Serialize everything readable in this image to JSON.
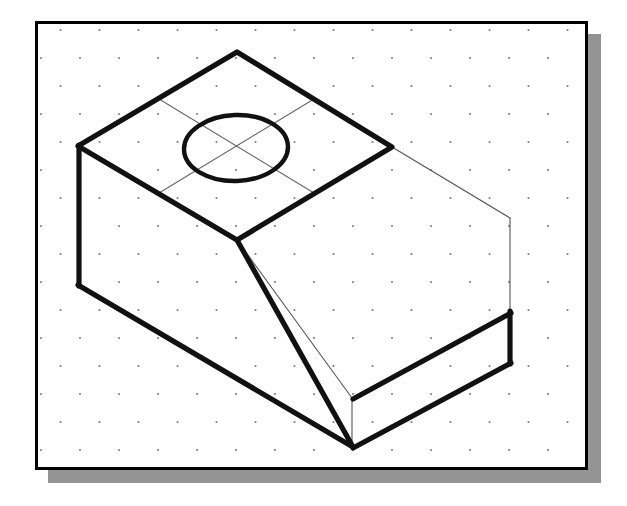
{
  "canvas": {
    "width": 627,
    "height": 506,
    "background_color": "#ffffff",
    "title": "Isometric pictorial drawing of a truncated rectangular block with a through hole"
  },
  "frame": {
    "name": "drawing-border",
    "x": 35,
    "y": 21,
    "width": 553,
    "height": 449,
    "stroke_color": "#000000",
    "stroke_width": 3,
    "fill_color": "#ffffff"
  },
  "shadow": {
    "name": "drop-shadow",
    "offset_x": 13,
    "offset_y": 13,
    "color": "#949494"
  },
  "grid": {
    "name": "isometric-dot-grid",
    "visible": true,
    "dot_color": "#808080",
    "dot_radius": 1.1,
    "spacing_x": 39,
    "spacing_y": 28,
    "stagger": true,
    "origin_x": 56,
    "origin_y": 38
  },
  "line_styles": {
    "visible_edge": {
      "color": "#111111",
      "width": 5.2,
      "label": "object line (thick)"
    },
    "construction_edge": {
      "color": "#555555",
      "width": 1.1,
      "label": "construction line (thin)"
    },
    "center_line": {
      "color": "#666666",
      "width": 1.1,
      "label": "center line (thin)"
    }
  },
  "geometry": {
    "vertices": {
      "top_apex": [
        237,
        52
      ],
      "top_left": [
        78,
        146
      ],
      "top_right": [
        392,
        147
      ],
      "top_front": [
        237,
        240
      ],
      "left_bottom": [
        79,
        285
      ],
      "bottom_apex": [
        352,
        447
      ],
      "band_right_top": [
        510,
        312
      ],
      "band_right_bottom": [
        510,
        362
      ],
      "right_far_top": [
        510,
        218
      ],
      "ghost_front_low": [
        352,
        398
      ]
    },
    "visible_edges": [
      {
        "name": "top-edge-left-upper",
        "from": [
          78,
          146
        ],
        "to": [
          237,
          52
        ]
      },
      {
        "name": "top-edge-right-upper",
        "from": [
          237,
          52
        ],
        "to": [
          392,
          147
        ]
      },
      {
        "name": "top-edge-left-lower",
        "from": [
          78,
          146
        ],
        "to": [
          237,
          240
        ]
      },
      {
        "name": "top-edge-right-lower",
        "from": [
          237,
          240
        ],
        "to": [
          392,
          147
        ]
      },
      {
        "name": "left-vertical-edge",
        "from": [
          78,
          146
        ],
        "to": [
          79,
          285
        ]
      },
      {
        "name": "left-lower-slope",
        "from": [
          79,
          285
        ],
        "to": [
          352,
          447
        ]
      },
      {
        "name": "chamfer-front-edge",
        "from": [
          237,
          240
        ],
        "to": [
          352,
          447
        ]
      },
      {
        "name": "band-top-edge",
        "from": [
          352,
          398
        ],
        "to": [
          510,
          312
        ]
      },
      {
        "name": "band-bottom-edge",
        "from": [
          352,
          447
        ],
        "to": [
          510,
          362
        ]
      },
      {
        "name": "band-right-vertical",
        "from": [
          510,
          312
        ],
        "to": [
          510,
          362
        ]
      },
      {
        "name": "bottom-apex-vertical",
        "from": [
          352,
          398
        ],
        "to": [
          352,
          447
        ]
      }
    ],
    "construction_edges": [
      {
        "name": "ghost-top-right-edge",
        "from": [
          392,
          147
        ],
        "to": [
          510,
          218
        ]
      },
      {
        "name": "ghost-right-vertical",
        "from": [
          510,
          218
        ],
        "to": [
          510,
          312
        ]
      },
      {
        "name": "ghost-inner-diagonal",
        "from": [
          237,
          240
        ],
        "to": [
          352,
          398
        ]
      },
      {
        "name": "ghost-front-right-edge",
        "from": [
          352,
          398
        ],
        "to": [
          510,
          312
        ]
      },
      {
        "name": "ghost-front-vertical",
        "from": [
          352,
          398
        ],
        "to": [
          352,
          447
        ]
      }
    ]
  },
  "hole": {
    "name": "through-hole-top-face",
    "shape": "ellipse",
    "center_x": 236,
    "center_y": 148,
    "radius_x": 52,
    "radius_y": 33,
    "rotation_deg": -2,
    "stroke_color": "#111111",
    "stroke_width": 4.4,
    "fill": "none"
  },
  "center_lines": [
    {
      "name": "center-line-axis-a",
      "from": [
        144,
        96
      ],
      "to": [
        330,
        200
      ]
    },
    {
      "name": "center-line-axis-b",
      "from": [
        144,
        200
      ],
      "to": [
        330,
        96
      ]
    }
  ],
  "construction_grid_lines": [
    {
      "name": "top-face-grid-line-upper",
      "from": [
        159,
        99
      ],
      "to": [
        314,
        193
      ]
    },
    {
      "name": "top-face-grid-line-lower",
      "from": [
        159,
        193
      ],
      "to": [
        314,
        99
      ]
    }
  ]
}
